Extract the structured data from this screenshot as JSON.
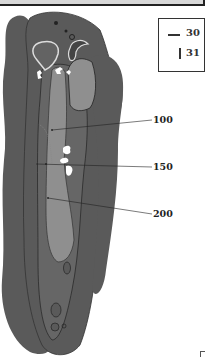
{
  "diagram": {
    "type": "golf-hole-layout",
    "legend": {
      "items": [
        {
          "symbol": "horizontal-line",
          "value": "30"
        },
        {
          "symbol": "vertical-line",
          "value": "31"
        }
      ]
    },
    "yardage_markers": [
      {
        "label": "100"
      },
      {
        "label": "150"
      },
      {
        "label": "200"
      }
    ],
    "colors": {
      "rough": "#5a5a5a",
      "fairway": "#8f8f8f",
      "green": "#636363",
      "bunker": "#ffffff",
      "outline": "#222222"
    }
  }
}
